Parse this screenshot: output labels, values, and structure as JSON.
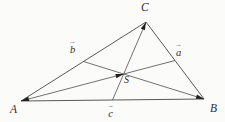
{
  "figure": {
    "kind": "triangle-with-medians-and-centroid",
    "background_color": "#fbfbf9",
    "line_color": "#595959",
    "arrow_color": "#1f1f1f",
    "label_color": "#2e2e2e",
    "vector_arrow_glyph": "→",
    "vertices": [
      {
        "id": "A",
        "label": "A",
        "x": 21,
        "y": 101
      },
      {
        "id": "B",
        "label": "B",
        "x": 204,
        "y": 99
      },
      {
        "id": "C",
        "label": "C",
        "x": 146,
        "y": 22
      }
    ],
    "centroid_label": "S",
    "sides": [
      [
        "A",
        "B"
      ],
      [
        "B",
        "C"
      ],
      [
        "C",
        "A"
      ]
    ],
    "medians": [
      {
        "from": "A",
        "to_midpoint_of": "BC"
      },
      {
        "from": "B",
        "to_midpoint_of": "AC"
      },
      {
        "from": "C",
        "to_midpoint_of": "AB"
      }
    ],
    "arrowheads": [
      {
        "tip_at": "A",
        "along_median_from": "A",
        "pointing": "into-vertex"
      },
      {
        "tip_at": "B",
        "along_median_from": "B",
        "pointing": "into-vertex"
      },
      {
        "tip_at": "C",
        "along_median_from": "C",
        "pointing": "into-vertex"
      },
      {
        "tip_at": "S",
        "along_median_from": "A",
        "pointing": "toward-midpoint"
      }
    ],
    "vector_labels": [
      {
        "id": "b",
        "text": "b",
        "near": "midpoint-of-AC"
      },
      {
        "id": "a",
        "text": "a",
        "near": "midpoint-of-BC"
      },
      {
        "id": "c",
        "text": "c",
        "near": "midpoint-of-AB"
      }
    ]
  }
}
